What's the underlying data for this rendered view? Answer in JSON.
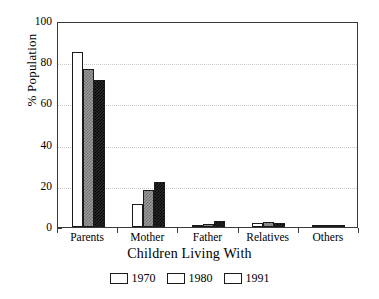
{
  "chart_data": {
    "type": "bar",
    "title": "",
    "xlabel": "Children Living With",
    "ylabel": "% Population",
    "categories": [
      "Parents",
      "Mother",
      "Father",
      "Relatives",
      "Others"
    ],
    "series": [
      {
        "name": "1970",
        "color": "#ffffff",
        "values": [
          85,
          11,
          1,
          2,
          0.5
        ]
      },
      {
        "name": "1980",
        "color": "#9a9a9a",
        "values": [
          76.5,
          18,
          1.5,
          2.5,
          0.5
        ]
      },
      {
        "name": "1991",
        "color": "#2b2b2b",
        "values": [
          71.5,
          22,
          3,
          2,
          0.5
        ]
      }
    ],
    "ylim": [
      0,
      100
    ],
    "yticks": [
      0,
      20,
      40,
      60,
      80,
      100
    ],
    "ytick_labels": [
      "0",
      "20",
      "40",
      "60",
      "80",
      "100"
    ],
    "yminor_ticks": [
      10,
      30,
      50,
      70,
      90
    ],
    "grid": true,
    "grid_axis": "y",
    "legend_position": "bottom"
  },
  "axes": {
    "y_title": "% Population",
    "x_title": "Children Living With"
  },
  "legend": {
    "items": [
      {
        "label": "1970"
      },
      {
        "label": "1980"
      },
      {
        "label": "1991"
      }
    ]
  }
}
